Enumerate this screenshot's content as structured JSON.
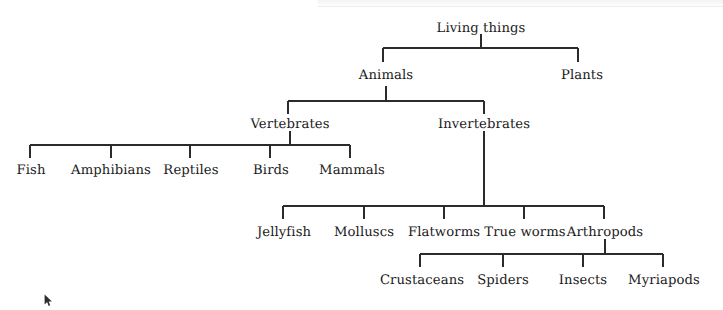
{
  "diagram": {
    "title_node": "Living things",
    "type": "hierarchy-tree",
    "line_color": "#2b2b2b",
    "text_color": "#1b1b1b",
    "background_color": "#ffffff",
    "nodes": {
      "root": "Living things",
      "level2": [
        "Animals",
        "Plants"
      ],
      "level3": [
        "Vertebrates",
        "Invertebrates"
      ],
      "vertebrate_groups": [
        "Fish",
        "Amphibians",
        "Reptiles",
        "Birds",
        "Mammals"
      ],
      "invertebrate_groups": [
        "Jellyfish",
        "Molluscs",
        "Flatworms",
        "True worms",
        "Arthropods"
      ],
      "arthropod_groups": [
        "Crustaceans",
        "Spiders",
        "Insects",
        "Myriapods"
      ]
    },
    "labels": {
      "root": "Living things",
      "animals": "Animals",
      "plants": "Plants",
      "vertebrates": "Vertebrates",
      "invertebrates": "Invertebrates",
      "fish": "Fish",
      "amphibians": "Amphibians",
      "reptiles": "Reptiles",
      "birds": "Birds",
      "mammals": "Mammals",
      "jellyfish": "Jellyfish",
      "molluscs": "Molluscs",
      "flatworms": "Flatworms",
      "true_worms": "True worms",
      "arthropods": "Arthropods",
      "crustaceans": "Crustaceans",
      "spiders": "Spiders",
      "insects": "Insects",
      "myriapods": "Myriapods"
    }
  },
  "cursor": {
    "icon": "mouse-pointer-icon"
  }
}
